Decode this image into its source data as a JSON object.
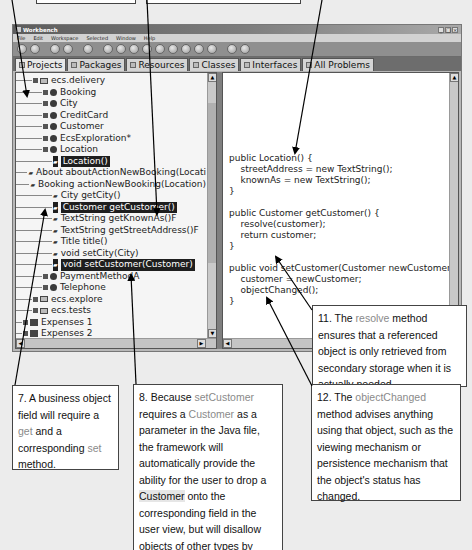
{
  "window": {
    "title": "Workbench",
    "controls": [
      "_",
      "□",
      "×"
    ]
  },
  "menubar": [
    "File",
    "Edit",
    "Workspace",
    "Selected",
    "Window",
    "Help"
  ],
  "tabs": [
    {
      "label": "Projects",
      "active": true
    },
    {
      "label": "Packages"
    },
    {
      "label": "Resources"
    },
    {
      "label": "Classes"
    },
    {
      "label": "Interfaces"
    },
    {
      "label": "All Problems"
    }
  ],
  "tree": [
    {
      "indent": 1,
      "type": "package",
      "label": "ecs.delivery"
    },
    {
      "indent": 2,
      "type": "class",
      "label": "Booking"
    },
    {
      "indent": 2,
      "type": "class",
      "label": "City"
    },
    {
      "indent": 2,
      "type": "class",
      "label": "CreditCard"
    },
    {
      "indent": 2,
      "type": "class",
      "label": "Customer"
    },
    {
      "indent": 2,
      "type": "class",
      "label": "EcsExploration*"
    },
    {
      "indent": 2,
      "type": "class",
      "label": "Location"
    },
    {
      "indent": 3,
      "type": "method",
      "label": "Location()",
      "selected": true
    },
    {
      "indent": 3,
      "type": "method",
      "label": "About aboutActionNewBooking(Locati"
    },
    {
      "indent": 3,
      "type": "method",
      "label": "Booking actionNewBooking(Location)"
    },
    {
      "indent": 3,
      "type": "method",
      "label": "City getCity()"
    },
    {
      "indent": 3,
      "type": "method",
      "label": "Customer getCustomer()",
      "selected": true
    },
    {
      "indent": 3,
      "type": "method",
      "label": "TextString getKnownAs()F"
    },
    {
      "indent": 3,
      "type": "method",
      "label": "TextString getStreetAddress()F"
    },
    {
      "indent": 3,
      "type": "method",
      "label": "Title title()"
    },
    {
      "indent": 3,
      "type": "method",
      "label": "void setCity(City)"
    },
    {
      "indent": 3,
      "type": "method",
      "label": "void setCustomer(Customer)",
      "selected": true
    },
    {
      "indent": 2,
      "type": "class",
      "label": "PaymentMethodA"
    },
    {
      "indent": 2,
      "type": "class",
      "label": "Telephone"
    },
    {
      "indent": 1,
      "type": "package",
      "label": "ecs.explore"
    },
    {
      "indent": 1,
      "type": "package",
      "label": "ecs.tests"
    },
    {
      "indent": 0,
      "type": "project",
      "label": "Expenses 1"
    },
    {
      "indent": 0,
      "type": "project",
      "label": "Expenses 2"
    }
  ],
  "code": [
    "public Location() {",
    "    streetAddress = new TextString();",
    "    knownAs = new TextString();",
    "}",
    "",
    "public Customer getCustomer() {",
    "    resolve(customer);",
    "    return customer;",
    "}",
    "",
    "public void setCustomer(Customer newCustomer) {",
    "    customer = newCustomer;",
    "    objectChanged();",
    "}"
  ],
  "callouts": {
    "c7": {
      "pre": "7. A business object field will require a ",
      "hl1": "get",
      "mid": " and a corresponding ",
      "hl2": "set",
      "post": " method."
    },
    "c8": {
      "pre": "8. Because ",
      "hl1": "setCustomer",
      "mid1": " requires a ",
      "hl2": "Customer",
      "mid2": " as a parameter in the Java file, the framework will automatically provide the ability for the user to drop a ",
      "hl3": "Customer",
      "post": " onto the corresponding field in the user view, but will disallow objects of other types by flashing the field red."
    },
    "c11": {
      "pre": "11. The ",
      "hl1": "resolve",
      "post": " method ensures that a referenced object is only retrieved from secondary storage when it is actually needed."
    },
    "c12": {
      "pre": "12. The ",
      "hl1": "objectChanged",
      "post": " method advises anything using that object, such as the viewing mechanism or persistence mechanism that the object's status has changed."
    }
  },
  "colors": {
    "highlight_text": "#8a8a8a",
    "selection": "#1e1e1e",
    "titlebar": "#5d5d5d"
  }
}
